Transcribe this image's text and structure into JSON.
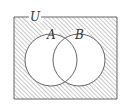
{
  "diagram": {
    "type": "venn",
    "universal_label": "U",
    "sets": [
      {
        "label": "A"
      },
      {
        "label": "B"
      }
    ],
    "shaded_region": "complement of A union B",
    "colors": {
      "stroke": "#444444",
      "hatch": "#777777",
      "background": "#ffffff"
    }
  }
}
